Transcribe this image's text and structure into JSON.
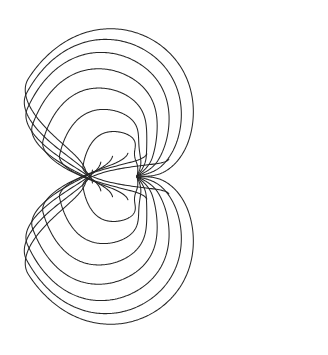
{
  "figure": {
    "width": 328,
    "height": 355,
    "background_color": "#ffffff",
    "stroke_color": "#262626",
    "stroke_width": 1.05,
    "symmetry": "mirror about horizontal axis"
  },
  "chart_data": {
    "type": "line",
    "xlabel": "",
    "ylabel": "",
    "grid": false,
    "legend": null,
    "xlim": [
      0,
      328
    ],
    "ylim": [
      0,
      355
    ],
    "node_point": {
      "x": 137,
      "y": 176
    },
    "right_cusp": {
      "x": 313,
      "y": 148
    },
    "left_cusp": {
      "x": -4,
      "y": 162
    },
    "mirror_axis_y": 176.5,
    "outer_radius_x": 160,
    "outer_radius_y": 175,
    "curve_count": 14,
    "spiral_turns": 1.02,
    "spiral_tightness": 0.52,
    "start_angles_deg": [
      -4,
      10,
      24,
      38,
      52,
      66,
      80,
      -4,
      10,
      24,
      38,
      52,
      66,
      80
    ],
    "mirrored_flags": [
      false,
      false,
      false,
      false,
      false,
      false,
      false,
      true,
      true,
      true,
      true,
      true,
      true,
      true
    ],
    "radial_scales": [
      1.0,
      0.965,
      0.92,
      0.855,
      0.765,
      0.645,
      0.49,
      1.0,
      0.965,
      0.92,
      0.855,
      0.765,
      0.645,
      0.49
    ],
    "samples_per_curve": 300
  }
}
